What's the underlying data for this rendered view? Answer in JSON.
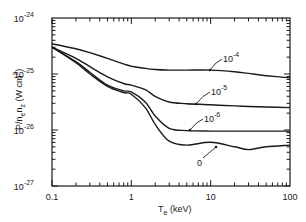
{
  "chart_data": {
    "type": "line",
    "title": "",
    "xlabel": "T_e (keV)",
    "ylabel": "P/n_e n_z (W cm^3)",
    "xscale": "log",
    "yscale": "log",
    "xlim": [
      0.1,
      100
    ],
    "ylim": [
      1e-27,
      1e-24
    ],
    "x_tick_labels": [
      "0.1",
      "1",
      "10",
      "100"
    ],
    "y_tick_labels": [
      {
        "base": "10",
        "exp": "-24"
      },
      {
        "base": "10",
        "exp": "-25"
      },
      {
        "base": "10",
        "exp": "-26"
      },
      {
        "base": "10",
        "exp": "-27"
      }
    ],
    "grid": false,
    "legend": "inline annotations",
    "x": [
      0.1,
      0.2,
      0.3,
      0.5,
      0.8,
      1,
      1.5,
      2,
      3,
      5,
      10,
      20,
      30,
      50,
      100
    ],
    "series": [
      {
        "name": "10^-4",
        "label_base": "10",
        "label_exp": "-4",
        "log10_values": [
          -24.46,
          -24.55,
          -24.62,
          -24.72,
          -24.82,
          -24.86,
          -24.9,
          -24.92,
          -24.93,
          -24.93,
          -24.93,
          -24.96,
          -24.99,
          -25.03,
          -25.07
        ]
      },
      {
        "name": "10^-5",
        "label_base": "10",
        "label_exp": "-5",
        "log10_values": [
          -24.52,
          -24.72,
          -24.87,
          -25.05,
          -25.17,
          -25.2,
          -25.28,
          -25.4,
          -25.5,
          -25.53,
          -25.55,
          -25.57,
          -25.58,
          -25.59,
          -25.6
        ]
      },
      {
        "name": "10^-6",
        "label_base": "10",
        "label_exp": "-6",
        "log10_values": [
          -24.52,
          -24.78,
          -24.97,
          -25.2,
          -25.3,
          -25.32,
          -25.5,
          -25.75,
          -25.97,
          -26.01,
          -26.02,
          -26.02,
          -26.02,
          -26.02,
          -26.02
        ]
      },
      {
        "name": "0",
        "label_base": "0",
        "label_exp": "",
        "log10_values": [
          -24.52,
          -24.8,
          -25.0,
          -25.22,
          -25.33,
          -25.36,
          -25.6,
          -25.9,
          -26.2,
          -26.27,
          -26.22,
          -26.3,
          -26.35,
          -26.3,
          -26.27
        ]
      }
    ]
  }
}
